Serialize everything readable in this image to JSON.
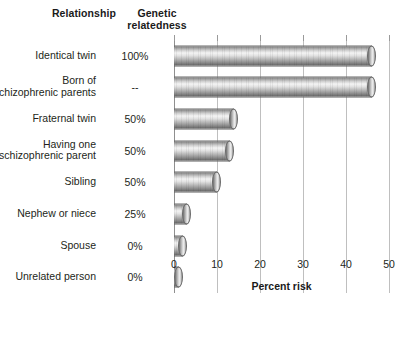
{
  "headers": {
    "relationship": "Relationship",
    "relatedness": "Genetic\nrelatedness"
  },
  "axis": {
    "title": "Percent risk",
    "ticks": [
      "0",
      "10",
      "20",
      "30",
      "40",
      "50"
    ],
    "min": 0,
    "max": 50
  },
  "rows": [
    {
      "label": "Identical twin",
      "relatedness": "100%",
      "value": 46
    },
    {
      "label": "Born of\nschizophrenic parents",
      "relatedness": "--",
      "value": 46
    },
    {
      "label": "Fraternal twin",
      "relatedness": "50%",
      "value": 14
    },
    {
      "label": "Having one\nschizophrenic parent",
      "relatedness": "50%",
      "value": 13
    },
    {
      "label": "Sibling",
      "relatedness": "50%",
      "value": 10
    },
    {
      "label": "Nephew or niece",
      "relatedness": "25%",
      "value": 3
    },
    {
      "label": "Spouse",
      "relatedness": "0%",
      "value": 2
    },
    {
      "label": "Unrelated person",
      "relatedness": "0%",
      "value": 1
    }
  ],
  "colors": {
    "background": "#ffffff",
    "text": "#231f20",
    "gridline": "#bfbfbf",
    "bar_light": "#f4f4f4",
    "bar_dark": "#6f6f6f"
  },
  "chart_data": {
    "type": "bar",
    "orientation": "horizontal",
    "title": "",
    "xlabel": "Percent risk",
    "ylabel": "Relationship",
    "xlim": [
      0,
      50
    ],
    "xticks": [
      0,
      10,
      20,
      30,
      40,
      50
    ],
    "grid": true,
    "legend": "none",
    "categories": [
      "Identical twin",
      "Born of schizophrenic parents",
      "Fraternal twin",
      "Having one schizophrenic parent",
      "Sibling",
      "Nephew or niece",
      "Spouse",
      "Unrelated person"
    ],
    "values": [
      46,
      46,
      14,
      13,
      10,
      3,
      2,
      1
    ],
    "annotations": {
      "column_header_1": "Relationship",
      "column_header_2": "Genetic relatedness",
      "genetic_relatedness": [
        "100%",
        "--",
        "50%",
        "50%",
        "50%",
        "25%",
        "0%",
        "0%"
      ]
    }
  }
}
